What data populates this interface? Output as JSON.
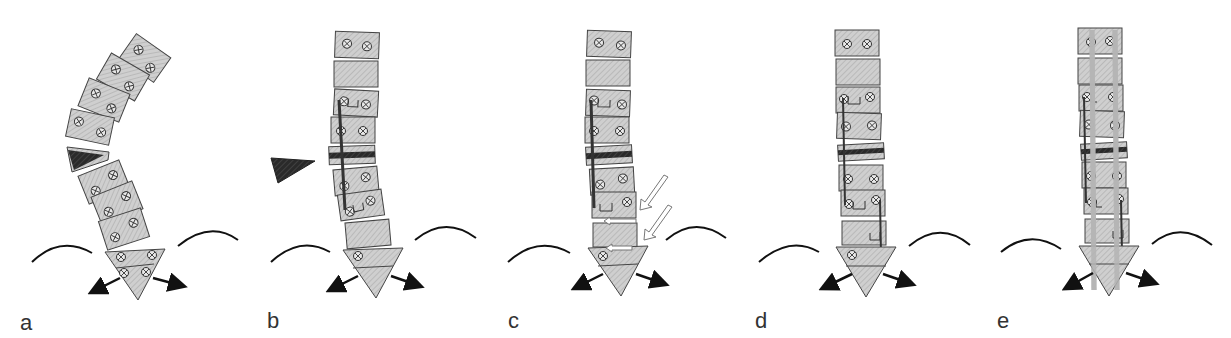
{
  "figure": {
    "panels": [
      {
        "label": "a",
        "x": 20
      },
      {
        "label": "b",
        "x": 267
      },
      {
        "label": "c",
        "x": 508
      },
      {
        "label": "d",
        "x": 755
      },
      {
        "label": "e",
        "x": 997
      }
    ],
    "colors": {
      "vertebra_fill": "#c8c8c8",
      "vertebra_stroke": "#444444",
      "wedge_dark": "#2a2a2a",
      "rod_dark": "#3a3a3a",
      "rod_light": "#b5b5b5",
      "arrow": "#111111"
    }
  }
}
